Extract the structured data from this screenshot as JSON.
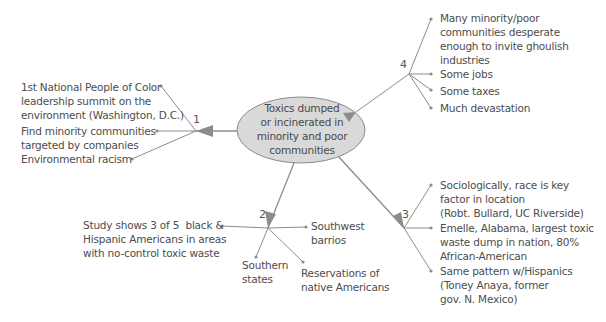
{
  "center": {
    "label": "Toxics dumped\nor incinerated in\nminority and poor\ncommunities",
    "fill": "#d9d9d9",
    "stroke": "#8a8a8a"
  },
  "branches": [
    {
      "number": "1",
      "items": [
        "1st National People of Color\nleadership summit on the\nenvironment (Washington, D.C.)",
        "Find minority communities\ntargeted by companies",
        "Environmental racism"
      ]
    },
    {
      "number": "2",
      "items": [
        "Study shows 3 of 5  black &\nHispanic Americans in areas\nwith no-control toxic waste",
        "Southwest\nbarrios",
        "Southern\nstates",
        "Reservations of\nnative Americans"
      ]
    },
    {
      "number": "3",
      "items": [
        "Sociologically, race is key\nfactor in location\n(Robt. Bullard, UC Riverside)",
        "Emelle, Alabama, largest toxic\nwaste dump in nation, 80%\nAfrican-American",
        "Same pattern w/Hispanics\n(Toney Anaya, former\ngov. N. Mexico)"
      ]
    },
    {
      "number": "4",
      "items": [
        "Many minority/poor\ncommunities desperate\nenough to invite ghoulish\nindustries",
        "Some jobs",
        "Some taxes",
        "Much devastation"
      ]
    }
  ],
  "colors": {
    "line": "#8c8c8c",
    "arrow": "#8c8c8c",
    "text": "#4d4d4d"
  }
}
